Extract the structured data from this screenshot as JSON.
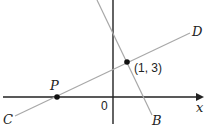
{
  "diagram": {
    "type": "coordinate-geometry",
    "axes": {
      "x_label": "x",
      "origin_label": "0"
    },
    "lines": [
      {
        "name": "CD",
        "start_label": "C",
        "end_label": "D",
        "color": "#a8a8a8"
      },
      {
        "name": "AB",
        "end_label": "B",
        "color": "#a8a8a8"
      }
    ],
    "points": [
      {
        "name": "intersection",
        "label": "(1, 3)"
      },
      {
        "name": "P",
        "label": "P"
      }
    ],
    "colors": {
      "axis": "#222222",
      "line": "#a8a8a8",
      "point": "#111111"
    }
  }
}
